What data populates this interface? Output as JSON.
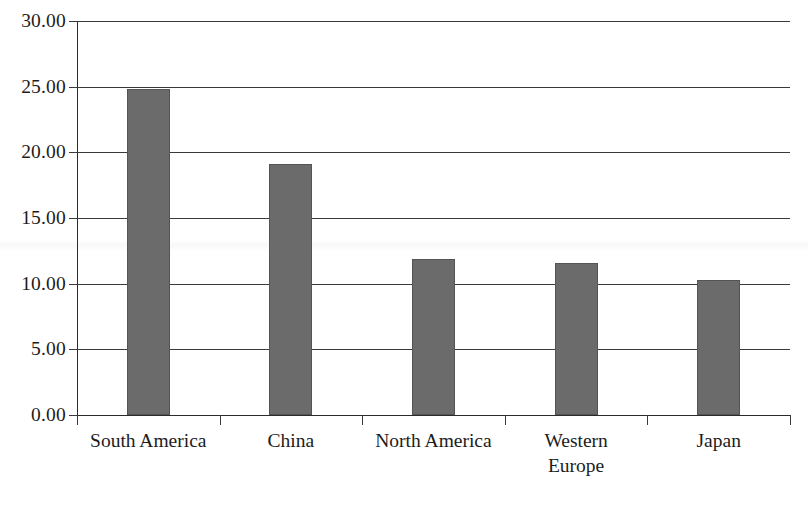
{
  "chart_data": {
    "type": "bar",
    "title": "",
    "subtitle": "",
    "xlabel": "",
    "ylabel": "",
    "categories": [
      "South America",
      "China",
      "North America",
      "Western\nEurope",
      "Japan"
    ],
    "values": [
      24.8,
      19.1,
      11.9,
      11.6,
      10.3
    ],
    "ylim": [
      0,
      30
    ],
    "ytick_step": 5,
    "ytick_labels": [
      "30.00",
      "25.00",
      "20.00",
      "15.00",
      "10.00",
      "5.00",
      "0.00"
    ],
    "ytick_values": [
      30,
      25,
      20,
      15,
      10,
      5,
      0
    ],
    "grid": "horizontal",
    "legend": "none",
    "bar_color": "#6b6b6b",
    "bar_edge_color": "#545454",
    "axis_color": "#2b2b2b",
    "gridline_color": "#3a3a3a",
    "background_color": "#ffffff",
    "annotations": []
  },
  "axes": {
    "y_ticks": [
      {
        "label": "30.00",
        "value": 30
      },
      {
        "label": "25.00",
        "value": 25
      },
      {
        "label": "20.00",
        "value": 20
      },
      {
        "label": "15.00",
        "value": 15
      },
      {
        "label": "10.00",
        "value": 10
      },
      {
        "label": "5.00",
        "value": 5
      },
      {
        "label": "0.00",
        "value": 0
      }
    ],
    "x_categories": [
      {
        "label": "South America",
        "value": 24.8
      },
      {
        "label": "China",
        "value": 19.1
      },
      {
        "label": "North America",
        "value": 11.9
      },
      {
        "label": "Western\nEurope",
        "value": 11.6
      },
      {
        "label": "Japan",
        "value": 10.3
      }
    ]
  }
}
